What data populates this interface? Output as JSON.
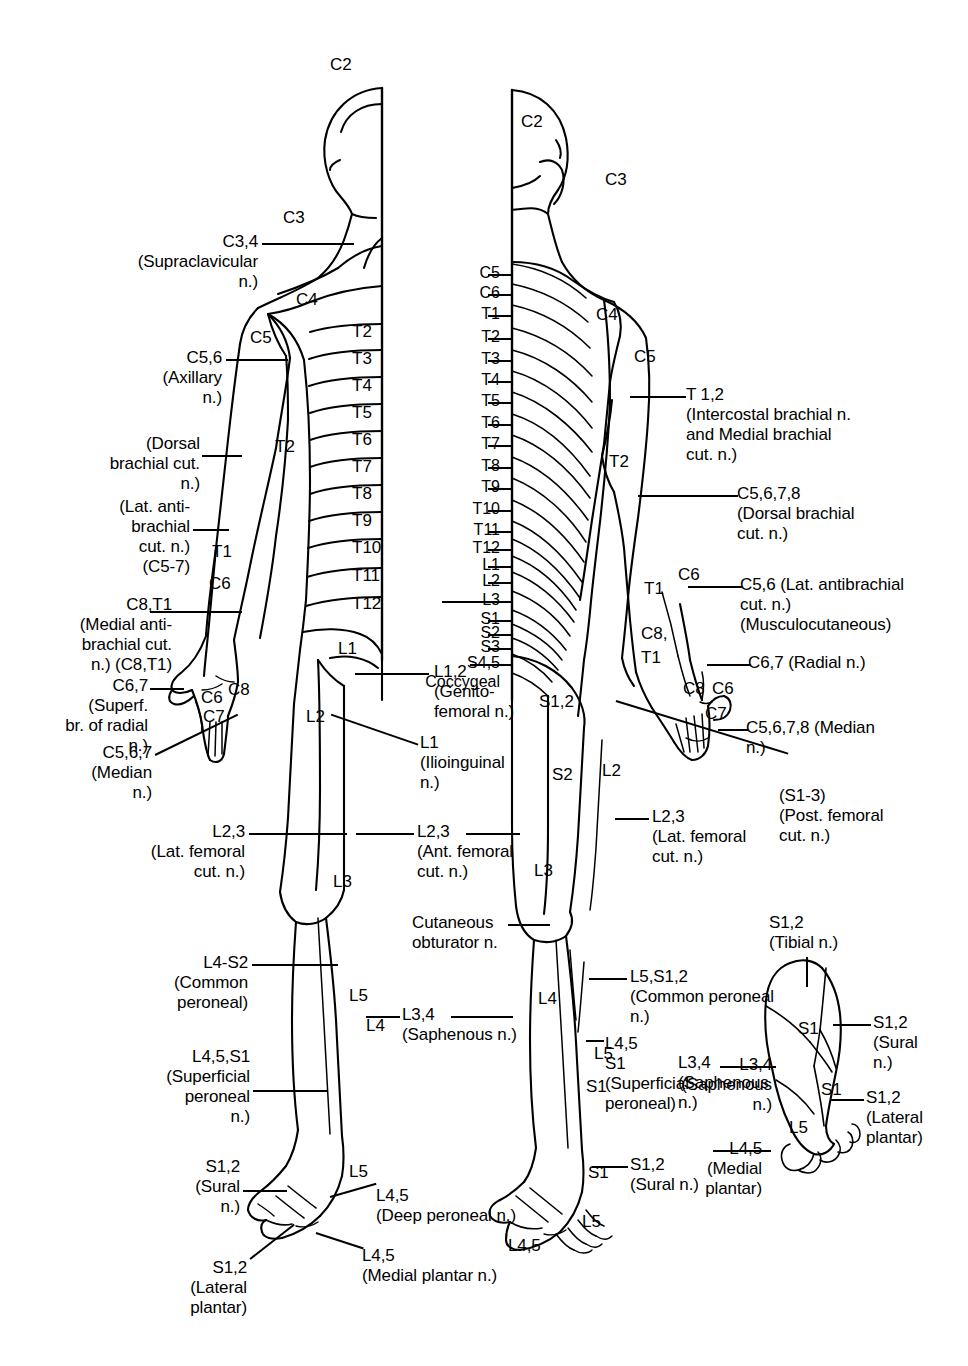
{
  "figure": {
    "views": [
      "anterior",
      "posterior",
      "plantar-foot"
    ],
    "line_color": "#000000",
    "background_color": "#ffffff"
  },
  "anterior": {
    "head_neck": [
      {
        "text": "C2",
        "x": 330,
        "y": 55
      },
      {
        "text": "C3",
        "x": 283,
        "y": 208
      },
      {
        "text": "C4",
        "x": 296,
        "y": 290
      },
      {
        "text": "C5",
        "x": 250,
        "y": 328
      }
    ],
    "trunk_bands": [
      {
        "text": "T2",
        "x": 352,
        "y": 322
      },
      {
        "text": "T3",
        "x": 352,
        "y": 349
      },
      {
        "text": "T4",
        "x": 352,
        "y": 376
      },
      {
        "text": "T5",
        "x": 352,
        "y": 403
      },
      {
        "text": "T6",
        "x": 352,
        "y": 430
      },
      {
        "text": "T7",
        "x": 352,
        "y": 457
      },
      {
        "text": "T8",
        "x": 352,
        "y": 484
      },
      {
        "text": "T9",
        "x": 352,
        "y": 511
      },
      {
        "text": "T10",
        "x": 352,
        "y": 538
      },
      {
        "text": "T11",
        "x": 352,
        "y": 566
      },
      {
        "text": "T12",
        "x": 352,
        "y": 594
      }
    ],
    "limb_segments": [
      {
        "text": "T2",
        "x": 275,
        "y": 437
      },
      {
        "text": "T1",
        "x": 212,
        "y": 542
      },
      {
        "text": "C6",
        "x": 209,
        "y": 574
      },
      {
        "text": "C6",
        "x": 201,
        "y": 688
      },
      {
        "text": "C8",
        "x": 228,
        "y": 680
      },
      {
        "text": "C7",
        "x": 203,
        "y": 707
      },
      {
        "text": "L1",
        "x": 338,
        "y": 639
      },
      {
        "text": "L2",
        "x": 306,
        "y": 707
      },
      {
        "text": "L3",
        "x": 333,
        "y": 872
      },
      {
        "text": "L5",
        "x": 349,
        "y": 986
      },
      {
        "text": "L4",
        "x": 366,
        "y": 1016
      },
      {
        "text": "L5",
        "x": 349,
        "y": 1162
      }
    ]
  },
  "posterior": {
    "head_neck": [
      {
        "text": "C2",
        "x": 521,
        "y": 112
      },
      {
        "text": "C3",
        "x": 605,
        "y": 170
      },
      {
        "text": "C4",
        "x": 596,
        "y": 305
      },
      {
        "text": "C5",
        "x": 634,
        "y": 347
      }
    ],
    "spine_list": [
      {
        "text": "C5",
        "y": 264
      },
      {
        "text": "C6",
        "y": 284
      },
      {
        "text": "T1",
        "y": 305
      },
      {
        "text": "T2",
        "y": 328
      },
      {
        "text": "T3",
        "y": 350
      },
      {
        "text": "T4",
        "y": 371
      },
      {
        "text": "T5",
        "y": 392
      },
      {
        "text": "T6",
        "y": 414
      },
      {
        "text": "T7",
        "y": 435
      },
      {
        "text": "T8",
        "y": 457
      },
      {
        "text": "T9",
        "y": 478
      },
      {
        "text": "T10",
        "y": 500
      },
      {
        "text": "T11",
        "y": 521
      },
      {
        "text": "T12",
        "y": 539
      },
      {
        "text": "L1",
        "y": 556
      },
      {
        "text": "L2",
        "y": 572
      },
      {
        "text": "L3",
        "y": 591
      },
      {
        "text": "S1",
        "y": 610
      },
      {
        "text": "S2",
        "y": 624
      },
      {
        "text": "S3",
        "y": 638
      },
      {
        "text": "S4,5",
        "y": 654
      },
      {
        "text": "Coccygeal",
        "y": 673
      }
    ],
    "limb_segments": [
      {
        "text": "T2",
        "x": 609,
        "y": 452
      },
      {
        "text": "T1",
        "x": 644,
        "y": 579
      },
      {
        "text": "C6",
        "x": 678,
        "y": 565
      },
      {
        "text": "C8,",
        "x": 641,
        "y": 624
      },
      {
        "text": "T1",
        "x": 641,
        "y": 648
      },
      {
        "text": "C8",
        "x": 683,
        "y": 679
      },
      {
        "text": "C6",
        "x": 712,
        "y": 679
      },
      {
        "text": "C7",
        "x": 705,
        "y": 704
      },
      {
        "text": "S1,2",
        "x": 539,
        "y": 692
      },
      {
        "text": "S2",
        "x": 552,
        "y": 765
      },
      {
        "text": "L2",
        "x": 602,
        "y": 761
      },
      {
        "text": "L3",
        "x": 534,
        "y": 861
      },
      {
        "text": "L4",
        "x": 538,
        "y": 989
      },
      {
        "text": "L5",
        "x": 594,
        "y": 1044
      },
      {
        "text": "S1",
        "x": 586,
        "y": 1077
      },
      {
        "text": "S1",
        "x": 588,
        "y": 1163
      },
      {
        "text": "L5",
        "x": 582,
        "y": 1212
      }
    ]
  },
  "foot": {
    "segments": [
      {
        "text": "S1",
        "x": 798,
        "y": 1019
      },
      {
        "text": "S1",
        "x": 821,
        "y": 1080
      },
      {
        "text": "L5",
        "x": 789,
        "y": 1118
      }
    ]
  },
  "labels_left": [
    {
      "id": "c34-supraclavicular",
      "lines": [
        "C3,4",
        "(Supraclavicular",
        "n.)"
      ],
      "x_right": 258,
      "y": 232,
      "leader": {
        "x": 262,
        "y": 243,
        "w": 92
      }
    },
    {
      "id": "c56-axillary",
      "lines": [
        "C5,6",
        "(Axillary",
        "n.)"
      ],
      "x_right": 222,
      "y": 348,
      "leader": {
        "x": 226,
        "y": 359,
        "w": 62
      }
    },
    {
      "id": "dorsal-brachial-cut",
      "lines": [
        "(Dorsal",
        "brachial cut.",
        "n.)"
      ],
      "x_right": 200,
      "y": 434,
      "leader": {
        "x": 202,
        "y": 455,
        "w": 40
      }
    },
    {
      "id": "lat-antibrachial-cut",
      "lines": [
        "(Lat. anti-",
        "brachial",
        "cut. n.)",
        "(C5-7)"
      ],
      "x_right": 190,
      "y": 497,
      "leader": {
        "x": 193,
        "y": 529,
        "w": 36
      }
    },
    {
      "id": "medial-antibrachial-cut",
      "lines": [
        "C8,T1",
        "(Medial anti-",
        "brachial cut.",
        "n.) (C8,T1)"
      ],
      "x_right": 172,
      "y": 595,
      "leader": {
        "x": 150,
        "y": 611,
        "w": 92
      }
    },
    {
      "id": "superf-br-radial",
      "lines": [
        "C6,7",
        "(Superf.",
        "br. of radial",
        "n.)"
      ],
      "x_right": 148,
      "y": 676,
      "leader": {
        "x": 150,
        "y": 688,
        "w": 34
      }
    },
    {
      "id": "median-n",
      "lines": [
        "C5,6,7",
        "(Median",
        "n.)"
      ],
      "x_right": 152,
      "y": 743,
      "diagonal": {
        "x": 155,
        "y": 754,
        "len": 92,
        "angle": -26
      }
    },
    {
      "id": "lat-femoral-cut-ant",
      "lines": [
        "L2,3",
        "(Lat. femoral",
        "cut. n.)"
      ],
      "x_right": 245,
      "y": 822,
      "leader": {
        "x": 249,
        "y": 833,
        "w": 98
      }
    },
    {
      "id": "common-peroneal-left",
      "lines": [
        "L4-S2",
        "(Common",
        "peroneal)"
      ],
      "x_right": 248,
      "y": 953,
      "leader": {
        "x": 252,
        "y": 964,
        "w": 86
      }
    },
    {
      "id": "superficial-peroneal-left",
      "lines": [
        "L4,5,S1",
        "(Superficial",
        "peroneal",
        "n.)"
      ],
      "x_right": 250,
      "y": 1047,
      "leader": {
        "x": 253,
        "y": 1090,
        "w": 74
      }
    },
    {
      "id": "sural-left",
      "lines": [
        "S1,2",
        "(Sural",
        "n.)"
      ],
      "x_right": 240,
      "y": 1157,
      "leader": {
        "x": 243,
        "y": 1190,
        "w": 44
      }
    },
    {
      "id": "lateral-plantar-left",
      "lines": [
        "S1,2",
        "(Lateral",
        "plantar)"
      ],
      "x_right": 247,
      "y": 1258,
      "diagonal": {
        "x": 250,
        "y": 1258,
        "len": 56,
        "angle": -38
      }
    }
  ],
  "labels_center": [
    {
      "id": "genitofemoral",
      "lines": [
        "L1,2",
        "(Genito-",
        "femoral n.)"
      ],
      "x_left": 434,
      "y": 662,
      "leader": {
        "x": 355,
        "y": 673,
        "w": 74
      }
    },
    {
      "id": "ilioinguinal",
      "lines": [
        "L1",
        "(Ilioinguinal",
        "n.)"
      ],
      "x_left": 420,
      "y": 733,
      "diagonal": {
        "x": 418,
        "y": 744,
        "len": 92,
        "angle": 199
      }
    },
    {
      "id": "ant-femoral-cut",
      "lines": [
        "L2,3",
        "(Ant. femoral",
        "cut. n.)"
      ],
      "x_left": 417,
      "y": 822,
      "leader_left": {
        "x": 356,
        "y": 833,
        "w": 58
      },
      "leader_right": {
        "x": 466,
        "y": 833,
        "w": 54
      }
    },
    {
      "id": "cutaneous-obturator",
      "lines": [
        "Cutaneous",
        "obturator n."
      ],
      "x_left": 412,
      "y": 913,
      "leader": {
        "x": 508,
        "y": 924,
        "w": 42
      }
    },
    {
      "id": "saphenous-center",
      "lines": [
        "L3,4",
        "(Saphenous n.)"
      ],
      "x_left": 402,
      "y": 1005,
      "leader_left": {
        "x": 366,
        "y": 1016,
        "w": 34
      },
      "leader_right": {
        "x": 451,
        "y": 1016,
        "w": 62
      }
    }
  ],
  "labels_right": [
    {
      "id": "intercostal-brachial",
      "lines": [
        "T 1,2",
        "(Intercostal brachial n.",
        "and Medial brachial",
        "cut. n.)"
      ],
      "x_left": 686,
      "y": 385,
      "leader": {
        "x": 630,
        "y": 396,
        "w": 56
      }
    },
    {
      "id": "dorsal-brachial-cut-right",
      "lines": [
        "C5,6,7,8",
        "(Dorsal brachial",
        "cut. n.)"
      ],
      "x_left": 737,
      "y": 484,
      "leader": {
        "x": 638,
        "y": 495,
        "w": 100
      }
    },
    {
      "id": "lat-antibrachial-musculocutaneous",
      "lines": [
        "C5,6 (Lat. antibrachial",
        "cut. n.)",
        "(Musculocutaneous)"
      ],
      "x_left": 740,
      "y": 575,
      "leader": {
        "x": 688,
        "y": 586,
        "w": 54
      }
    },
    {
      "id": "radial-n",
      "lines": [
        "C6,7 (Radial n.)"
      ],
      "x_left": 748,
      "y": 653,
      "leader": {
        "x": 707,
        "y": 664,
        "w": 44
      }
    },
    {
      "id": "median-n-right",
      "lines": [
        "C5,6,7,8 (Median",
        "n.)"
      ],
      "x_left": 746,
      "y": 718,
      "leader": {
        "x": 718,
        "y": 729,
        "w": 30
      }
    },
    {
      "id": "post-femoral-cut",
      "lines": [
        "(S1-3)",
        "(Post. femoral",
        "cut. n.)"
      ],
      "x_left": 779,
      "y": 786,
      "diagonal": {
        "x": 616,
        "y": 700,
        "len": 180,
        "angle": 17
      }
    },
    {
      "id": "lat-femoral-cut-post",
      "lines": [
        "L2,3",
        "(Lat. femoral",
        "cut. n.)"
      ],
      "x_left": 652,
      "y": 807,
      "leader": {
        "x": 615,
        "y": 818,
        "w": 34
      }
    },
    {
      "id": "common-peroneal-right",
      "lines": [
        "L5,S1,2",
        "(Common peroneal",
        "n.)"
      ],
      "x_left": 630,
      "y": 967,
      "leader": {
        "x": 589,
        "y": 978,
        "w": 38
      }
    },
    {
      "id": "superficial-peroneal-right",
      "lines": [
        "L4,5",
        "S1",
        "(Superficial",
        "peroneal)"
      ],
      "x_left": 605,
      "y": 1034,
      "leader": {
        "x": 586,
        "y": 1040,
        "w": 18
      }
    },
    {
      "id": "saphenous-right",
      "lines": [
        "L3,4",
        "(Saphenous",
        "n.)"
      ],
      "x_left": 678,
      "y": 1053,
      "leader": null
    },
    {
      "id": "sural-right",
      "lines": [
        "S1,2",
        "(Sural n.)"
      ],
      "x_left": 630,
      "y": 1155,
      "leader": {
        "x": 592,
        "y": 1166,
        "w": 36
      }
    },
    {
      "id": "l45-bottom",
      "lines": [
        "L4,5"
      ],
      "x_left": 508,
      "y": 1236,
      "leader": null
    }
  ],
  "labels_foot": [
    {
      "id": "tibial-n",
      "lines": [
        "S1,2",
        "(Tibial n.)"
      ],
      "x_left": 769,
      "y": 913,
      "vleader": {
        "x": 806,
        "y": 957,
        "h": 30
      }
    },
    {
      "id": "sural-n-foot",
      "lines": [
        "S1,2",
        "(Sural",
        "n.)"
      ],
      "x_left": 873,
      "y": 1013,
      "leader": {
        "x": 833,
        "y": 1024,
        "w": 38
      }
    },
    {
      "id": "lateral-plantar-foot",
      "lines": [
        "S1,2",
        "(Lateral",
        "plantar)"
      ],
      "x_left": 866,
      "y": 1088,
      "leader": {
        "x": 830,
        "y": 1099,
        "w": 34
      }
    },
    {
      "id": "saphenous-foot",
      "lines": [
        "L3,4",
        "(Saphenous",
        "n.)"
      ],
      "x_right": 772,
      "y": 1055,
      "leader": {
        "x": 720,
        "y": 1066,
        "w": 56
      }
    },
    {
      "id": "medial-plantar-foot",
      "lines": [
        "L4,5",
        "(Medial",
        "plantar)"
      ],
      "x_right": 762,
      "y": 1139,
      "leader": {
        "x": 713,
        "y": 1150,
        "w": 58
      }
    }
  ],
  "labels_bottom_left": [
    {
      "id": "deep-peroneal",
      "lines": [
        "L4,5",
        "(Deep peroneal n.)"
      ],
      "x_left": 376,
      "y": 1186,
      "diagonal": {
        "x": 330,
        "y": 1196,
        "len": 48,
        "angle": -16
      }
    },
    {
      "id": "medial-plantar-n",
      "lines": [
        "L4,5",
        "(Medial plantar n.)"
      ],
      "x_left": 362,
      "y": 1246,
      "diagonal": {
        "x": 316,
        "y": 1232,
        "len": 50,
        "angle": 18
      }
    }
  ]
}
